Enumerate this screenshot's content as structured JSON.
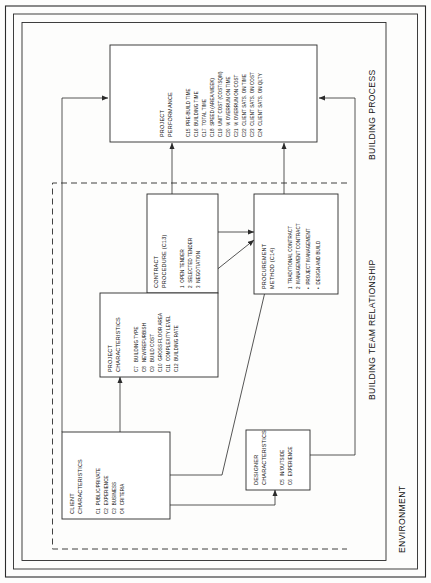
{
  "diagram": {
    "type": "conceptual-block-diagram",
    "orientation": "rotated-90-ccw",
    "regions": [
      {
        "id": "environment",
        "label": "ENVIRONMENT",
        "style": "solid"
      },
      {
        "id": "building_process",
        "label": "BUILDING PROCESS",
        "style": "solid"
      },
      {
        "id": "building_team_relationship",
        "label": "BUILDING TEAM RELATIONSHIP",
        "style": "dashed"
      }
    ],
    "nodes": [
      {
        "id": "project_performance",
        "title_line1": "PROJECT",
        "title_line2": "PERFORMANCE",
        "items": [
          "C15  PRE-BUILD TIME",
          "C16  BUILDING TIME",
          "C17  TOTAL TIME",
          "C18  SPEED (AREA/WEEK)",
          "C19  UNIT COST (COST/SQM)",
          "C20  % OVERRUN ON TIME",
          "C21  % OVERRUN ON COST",
          "C22  CLIENT SATS. ON TIME",
          "C23  CLIENT SATS. ON COST",
          "C24  CLIENT SATS. ON QLTY"
        ]
      },
      {
        "id": "contract_procedure",
        "title_line1": "CONTRACT",
        "title_line2": "PROCEDURE (C13)",
        "items": [
          "1  OPEN TENDER",
          "2  SELECTED TENDER",
          "3  NEGOTIATION"
        ]
      },
      {
        "id": "procurement_method",
        "title_line1": "PROCUREMENT",
        "title_line2": "METHOD (C14)",
        "items": [
          "1  TRADITIONAL CONTRACT",
          "2  MANAGEMENT CONTRACT",
          "•  PROJECT MANAGEMENT",
          "•  DESIGN AND BUILD"
        ]
      },
      {
        "id": "project_characteristics",
        "title_line1": "PROJECT",
        "title_line2": "CHARACTERISTICS",
        "items": [
          "C7   BUILDING TYPE",
          "C8   NEW/REFURBISH",
          "C9   BUILD COST",
          "C10  GROSS FLOOR AREA",
          "C11  COMPLEXITY LEVEL",
          "C12  BUILDING RATE"
        ]
      },
      {
        "id": "client_characteristics",
        "title_line1": "CLIENT",
        "title_line2": "CHARACTERISTICS",
        "items": [
          "C1  PUBLIC/PRIVATE",
          "C2  EXPERIENCE",
          "C3  BUSINESS",
          "C4  CRITERIA"
        ]
      },
      {
        "id": "designer_characteristics",
        "title_line1": "DESIGNER",
        "title_line2": "CHARACTERISTICS",
        "items": [
          "C5  IN/OUTSIDE",
          "C6  EXPERIENCE"
        ]
      }
    ],
    "edges": [
      {
        "from": "client_characteristics",
        "to": "project_performance"
      },
      {
        "from": "client_characteristics",
        "to": "project_characteristics"
      },
      {
        "from": "client_characteristics",
        "to": "procurement_method"
      },
      {
        "from": "client_characteristics",
        "to": "designer_characteristics"
      },
      {
        "from": "project_characteristics",
        "to": "contract_procedure"
      },
      {
        "from": "project_characteristics",
        "to": "procurement_method"
      },
      {
        "from": "contract_procedure",
        "to": "project_performance"
      },
      {
        "from": "contract_procedure",
        "to": "procurement_method"
      },
      {
        "from": "procurement_method",
        "to": "project_performance"
      },
      {
        "from": "designer_characteristics",
        "to": "project_performance"
      }
    ],
    "colors": {
      "stroke": "#2b2b2b",
      "text": "#111111",
      "background": "#fdfdfc",
      "node_fill": "#ffffff"
    }
  }
}
